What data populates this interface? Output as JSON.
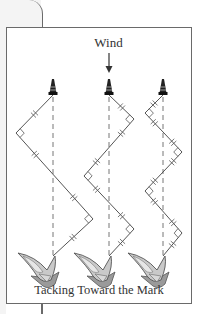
{
  "diagram": {
    "title": "Tacking Toward the Mark",
    "wind_label": "Wind",
    "colors": {
      "frame": "#6a6a6a",
      "path": "#555555",
      "dashed_line": "#777777",
      "boat_fill": "#c8c8c8",
      "boat_dark": "#8a8a8a",
      "buoy": "#222222",
      "background_card": "#f4f4f4"
    },
    "routes": [
      {
        "name": "route-1",
        "tacks": 2,
        "points": [
          [
            53,
            256
          ],
          [
            93,
            219
          ],
          [
            16,
            133
          ],
          [
            53,
            95
          ]
        ]
      },
      {
        "name": "route-2",
        "tacks": 3,
        "points": [
          [
            109,
            256
          ],
          [
            134,
            229
          ],
          [
            84,
            176
          ],
          [
            134,
            119
          ],
          [
            109,
            95
          ]
        ]
      },
      {
        "name": "route-3",
        "tacks": 4,
        "points": [
          [
            163,
            256
          ],
          [
            182,
            233
          ],
          [
            145,
            191
          ],
          [
            182,
            152
          ],
          [
            145,
            113
          ],
          [
            163,
            95
          ]
        ]
      }
    ],
    "mark_x": [
      53,
      109,
      163
    ],
    "mark_y": 90,
    "boat_y": 262
  }
}
